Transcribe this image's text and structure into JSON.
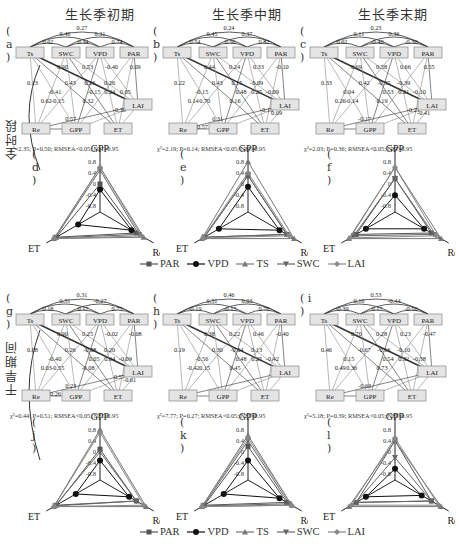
{
  "columns": [
    "生长季初期",
    "生长季中期",
    "生长季末期"
  ],
  "rows": [
    "全时段",
    "干旱期间"
  ],
  "legend": [
    {
      "name": "PAR",
      "marker": "square",
      "color": "#555555"
    },
    {
      "name": "VPD",
      "marker": "circle",
      "color": "#111111"
    },
    {
      "name": "TS",
      "marker": "triangle-up",
      "color": "#777777"
    },
    {
      "name": "SWC",
      "marker": "triangle-down",
      "color": "#666666"
    },
    {
      "name": "LAI",
      "marker": "diamond",
      "color": "#888888"
    }
  ],
  "path_panels": [
    {
      "label": "( a )",
      "stats": "χ²=2.35; P=0.50; RMSEA<0.05; NFI>0.95",
      "top_coefs": [
        "0.27",
        "0.46",
        "0.31",
        "0.02",
        "0.34",
        "0.74"
      ],
      "coefs": [
        "0.90",
        "0.13",
        "-0.41",
        "0.32",
        "0.53",
        "0.43",
        "-0.15",
        "0.62",
        "-0.40",
        "0.26",
        "0.24",
        "-0.15",
        "0.09",
        "0.26",
        "0.05",
        "0.57",
        "-0.38"
      ]
    },
    {
      "label": "( b )",
      "stats": "χ²=2.19; P=0.14; RMSEA<0.05; NFI>0.95",
      "top_coefs": [
        "0.24",
        "0.45",
        "0.37",
        "0.54",
        "0.56",
        "0.82"
      ],
      "coefs": [
        "0.44",
        "0.22",
        "-0.15",
        "0.16",
        "0.24",
        "0.43",
        "0.48",
        "0.14",
        "0.33",
        "0.15",
        "0.25",
        "0.70",
        "-0.10",
        "-0.09",
        "-0.09",
        "0.31",
        "-0.15",
        "0.09",
        "-0.57"
      ]
    },
    {
      "label": "( c )",
      "stats": "χ²=2.03; P=0.36; RMSEA<0.05; NFI>0.95",
      "top_coefs": [
        "0.23",
        "0.11",
        "0.36",
        "0.02",
        "-0.40",
        "-0.30"
      ],
      "coefs": [
        "0.69",
        "0.33",
        "0.04",
        "0.19",
        "0.58",
        "0.42",
        "0.53",
        "0.26",
        "0.66",
        "-0.35",
        "0.21",
        "-0.14",
        "0.55",
        "-0.39",
        "-0.10",
        "-0.17",
        "-0.21",
        "-0.41"
      ]
    },
    {
      "label": "( g )",
      "stats": "χ²=0.44; P=0.51; RMSEA<0.05; NFI>0.95",
      "top_coefs": [
        "0.31",
        "0.51",
        "-0.27",
        "0.18",
        "0.17",
        "0.75"
      ],
      "coefs": [
        "0.90",
        "0.08",
        "-0.40",
        "-0.08",
        "0.25",
        "0.26",
        "0.05",
        "0.03",
        "-0.02",
        "-0.08",
        "0.64",
        "-0.55",
        "-0.08",
        "0.20",
        "-0.09",
        "0.23",
        "0.57",
        "-0.61",
        "-0.26"
      ]
    },
    {
      "label": "( h )",
      "stats": "χ²=7.77; P=0.27; RMSEA<0.05; NFI>0.95",
      "top_coefs": [
        "0.46",
        "0.51",
        "0.03",
        "-0.19",
        "-0.15",
        "0.76"
      ],
      "coefs": [
        "0.38",
        "0.19",
        "-0.56",
        "0.45",
        "0.22",
        "0.30",
        "0.48",
        "-0.42",
        "0.46",
        "-0.04",
        "0.25",
        "0.15",
        "-0.40",
        "0.13",
        "-0.42"
      ]
    },
    {
      "label": "( i )",
      "stats": "χ²=5.18; P=0.39; RMSEA<0.05; NFI>0.95",
      "top_coefs": [
        "0.53",
        "0.16",
        "-0.44",
        "-0.39",
        "0.17",
        "-0.50"
      ],
      "coefs": [
        "0.70",
        "0.46",
        "0.15",
        "0.73",
        "0.28",
        "-0.67",
        "0.54",
        "0.49",
        "0.23",
        "-0.16",
        "0.32",
        "0.36",
        "-0.47",
        "-0.10",
        "-0.38",
        "-0.63"
      ]
    }
  ],
  "nodes": [
    "Ts",
    "SWC",
    "VPD",
    "PAR",
    "LAI",
    "Re",
    "GPP",
    "ET"
  ],
  "radar_panels": [
    {
      "label": "( d )"
    },
    {
      "label": "( e )"
    },
    {
      "label": "( f )"
    },
    {
      "label": "( j )"
    },
    {
      "label": "( k )"
    },
    {
      "label": "( l )"
    }
  ],
  "radar_axes": [
    "GPP",
    "Re",
    "ET"
  ],
  "radar_ticks": [
    "0.8",
    "0.4",
    "0",
    "-0.4",
    "-0.8"
  ],
  "chart_data": [
    {
      "type": "radar",
      "title": "(d) 全时段 生长季初期",
      "axes": [
        "GPP",
        "Re",
        "ET"
      ],
      "range": [
        -1,
        1
      ],
      "series": [
        {
          "name": "PAR",
          "values": [
            0.0,
            0.5,
            0.8
          ]
        },
        {
          "name": "VPD",
          "values": [
            -0.2,
            0.3,
            -0.1
          ]
        },
        {
          "name": "TS",
          "values": [
            0.6,
            0.8,
            0.9
          ]
        },
        {
          "name": "SWC",
          "values": [
            0.5,
            0.6,
            0.85
          ]
        },
        {
          "name": "LAI",
          "values": [
            0.6,
            0.7,
            0.9
          ]
        }
      ]
    },
    {
      "type": "radar",
      "title": "(e) 全时段 生长季中期",
      "axes": [
        "GPP",
        "Re",
        "ET"
      ],
      "range": [
        -1,
        1
      ],
      "series": [
        {
          "name": "PAR",
          "values": [
            0.3,
            0.6,
            0.8
          ]
        },
        {
          "name": "VPD",
          "values": [
            -0.1,
            0.3,
            0.2
          ]
        },
        {
          "name": "TS",
          "values": [
            0.8,
            0.9,
            0.9
          ]
        },
        {
          "name": "SWC",
          "values": [
            0.3,
            0.6,
            0.8
          ]
        },
        {
          "name": "LAI",
          "values": [
            0.4,
            0.7,
            0.85
          ]
        }
      ]
    },
    {
      "type": "radar",
      "title": "(f) 全时段 生长季末期",
      "axes": [
        "GPP",
        "Re",
        "ET"
      ],
      "range": [
        -1,
        1
      ],
      "series": [
        {
          "name": "PAR",
          "values": [
            0.2,
            0.5,
            0.6
          ]
        },
        {
          "name": "VPD",
          "values": [
            -0.4,
            0.2,
            0.2
          ]
        },
        {
          "name": "TS",
          "values": [
            0.6,
            0.9,
            0.9
          ]
        },
        {
          "name": "SWC",
          "values": [
            0.2,
            0.6,
            0.7
          ]
        },
        {
          "name": "LAI",
          "values": [
            0.6,
            0.7,
            0.85
          ]
        }
      ]
    },
    {
      "type": "radar",
      "title": "(j) 干旱期间 生长季初期",
      "axes": [
        "GPP",
        "Re",
        "ET"
      ],
      "range": [
        -1,
        1
      ],
      "series": [
        {
          "name": "PAR",
          "values": [
            0.1,
            0.5,
            0.8
          ]
        },
        {
          "name": "VPD",
          "values": [
            -0.3,
            0.2,
            0.0
          ]
        },
        {
          "name": "TS",
          "values": [
            0.8,
            0.9,
            0.9
          ]
        },
        {
          "name": "SWC",
          "values": [
            0.0,
            0.5,
            0.85
          ]
        },
        {
          "name": "LAI",
          "values": [
            0.7,
            0.8,
            0.9
          ]
        }
      ]
    },
    {
      "type": "radar",
      "title": "(k) 干旱期间 生长季中期",
      "axes": [
        "GPP",
        "Re",
        "ET"
      ],
      "range": [
        -1,
        1
      ],
      "series": [
        {
          "name": "PAR",
          "values": [
            0.2,
            0.6,
            0.8
          ]
        },
        {
          "name": "VPD",
          "values": [
            -0.3,
            0.3,
            0.0
          ]
        },
        {
          "name": "TS",
          "values": [
            0.6,
            0.8,
            0.9
          ]
        },
        {
          "name": "SWC",
          "values": [
            0.4,
            0.7,
            0.85
          ]
        },
        {
          "name": "LAI",
          "values": [
            0.5,
            0.8,
            0.9
          ]
        }
      ]
    },
    {
      "type": "radar",
      "title": "(l) 干旱期间 生长季末期",
      "axes": [
        "GPP",
        "Re",
        "ET"
      ],
      "range": [
        -1,
        1
      ],
      "series": [
        {
          "name": "PAR",
          "values": [
            0.4,
            0.5,
            0.6
          ]
        },
        {
          "name": "VPD",
          "values": [
            -0.6,
            0.1,
            0.2
          ]
        },
        {
          "name": "TS",
          "values": [
            0.4,
            0.9,
            0.9
          ]
        },
        {
          "name": "SWC",
          "values": [
            -0.2,
            0.5,
            0.6
          ]
        },
        {
          "name": "LAI",
          "values": [
            0.5,
            0.8,
            0.8
          ]
        }
      ]
    }
  ]
}
